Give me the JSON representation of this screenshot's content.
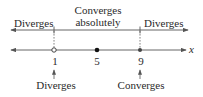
{
  "diagram": {
    "type": "number-line",
    "axis_label": "x",
    "regions": [
      {
        "label": "Diverges",
        "side": "left"
      },
      {
        "label_line1": "Converges",
        "label_line2": "absolutely",
        "side": "middle"
      },
      {
        "label": "Diverges",
        "side": "right"
      }
    ],
    "points": [
      {
        "value": "1",
        "marker": "open-circle",
        "note": "Diverges"
      },
      {
        "value": "5",
        "marker": "filled-dot",
        "note": ""
      },
      {
        "value": "9",
        "marker": "filled-dot",
        "note": "Converges"
      }
    ],
    "colors": {
      "line": "#555555",
      "text": "#2a2a2a",
      "dot": "#111111",
      "background": "#ffffff"
    }
  }
}
